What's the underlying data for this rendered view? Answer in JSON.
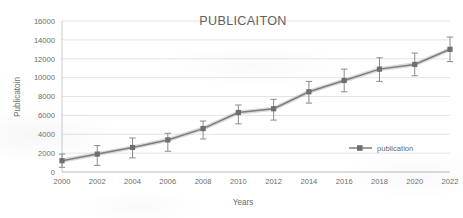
{
  "chart_data": {
    "type": "line",
    "title": "PUBLICAITON",
    "xlabel": "Years",
    "ylabel": "Publicatoin",
    "categories": [
      2000,
      2002,
      2004,
      2006,
      2008,
      2010,
      2012,
      2014,
      2016,
      2018,
      2020,
      2022
    ],
    "xtick_labels": [
      "2000",
      "2002",
      "2004",
      "2006",
      "2008",
      "2010",
      "2012",
      "2014",
      "2016",
      "2018",
      "2020",
      "2022"
    ],
    "ytick_labels": [
      "0",
      "2000",
      "4000",
      "6000",
      "8000",
      "10000",
      "12000",
      "14000",
      "16000"
    ],
    "yticks": [
      0,
      2000,
      4000,
      6000,
      8000,
      10000,
      12000,
      14000,
      16000
    ],
    "ylim": [
      0,
      16000
    ],
    "xlim": [
      2000,
      2022
    ],
    "grid": "horizontal",
    "legend_position": "inside-right",
    "series": [
      {
        "name": "publication",
        "color": "#7d7d7d",
        "marker": "square",
        "values": [
          1200,
          1900,
          2600,
          3400,
          4600,
          6300,
          6700,
          8500,
          9700,
          10900,
          11400,
          13000
        ],
        "error_upper": [
          700,
          900,
          1000,
          700,
          800,
          800,
          1000,
          1100,
          1200,
          1200,
          1200,
          1300
        ],
        "error_lower": [
          700,
          1200,
          1100,
          1200,
          1100,
          1200,
          1200,
          1200,
          1200,
          1300,
          1200,
          1300
        ]
      }
    ],
    "legend_entries": [
      "publication"
    ]
  }
}
